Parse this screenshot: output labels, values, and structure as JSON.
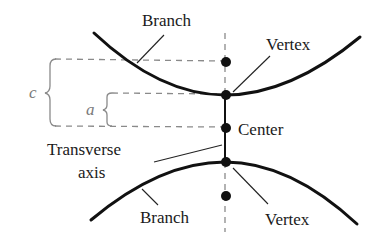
{
  "diagram": {
    "labels": {
      "branch_top": "Branch",
      "vertex_top": "Vertex",
      "center": "Center",
      "transverse_axis_line1": "Transverse",
      "transverse_axis_line2": "axis",
      "branch_bottom": "Branch",
      "vertex_bottom": "Vertex",
      "c": "c",
      "a": "a"
    },
    "points": [
      {
        "name": "focus-top",
        "x": 225,
        "y": 62
      },
      {
        "name": "vertex-top",
        "x": 225,
        "y": 95
      },
      {
        "name": "center",
        "x": 225,
        "y": 128
      },
      {
        "name": "vertex-bottom",
        "x": 225,
        "y": 162
      },
      {
        "name": "focus-bottom",
        "x": 225,
        "y": 196
      }
    ],
    "colors": {
      "curve": "#111111",
      "dashed": "#8a8a8a",
      "text": "#1a1a1a",
      "variable_text": "#7a7a7a"
    }
  }
}
